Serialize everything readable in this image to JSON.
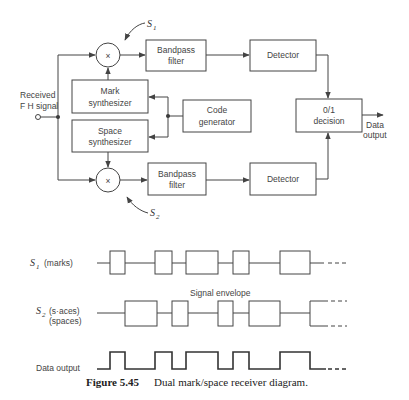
{
  "figure": {
    "number_label": "Figure 5.45",
    "caption": "Dual mark/space receiver diagram."
  },
  "block_diagram": {
    "input_label_line1": "Received",
    "input_label_line2": "F H signal",
    "mixer_symbol": "×",
    "mixer_top_label": "S",
    "mixer_top_sub": "1",
    "mixer_bottom_label": "S",
    "mixer_bottom_sub": "2",
    "bandpass_top": {
      "line1": "Bandpass",
      "line2": "filter"
    },
    "detector_top": {
      "label": "Detector"
    },
    "mark_synth": {
      "line1": "Mark",
      "line2": "synthesizer"
    },
    "code_gen": {
      "line1": "Code",
      "line2": "generator"
    },
    "space_synth": {
      "line1": "Space",
      "line2": "synthesizer"
    },
    "bandpass_bottom": {
      "line1": "Bandpass",
      "line2": "filter"
    },
    "detector_bottom": {
      "label": "Detector"
    },
    "decision": {
      "line1": "0/1",
      "line2": "decision"
    },
    "output_label_line1": "Data",
    "output_label_line2": "output"
  },
  "waveforms": {
    "s1_symbol": "S",
    "s1_sub": "1",
    "s1_label": "(marks)",
    "envelope_label": "Signal envelope",
    "s2_symbol": "S",
    "s2_sub": "2",
    "s2_label_line1": "(s·aces)",
    "s2_label_line2": "(spaces)",
    "data_output_label": "Data output"
  }
}
